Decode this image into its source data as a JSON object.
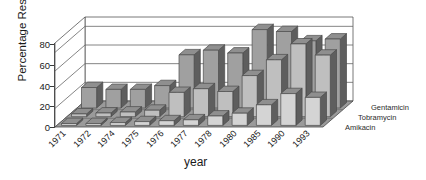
{
  "chart_data": {
    "type": "bar",
    "title": "",
    "subtitle": "",
    "xlabel": "year",
    "ylabel": "Percentage Resistance",
    "ylim": [
      0,
      90
    ],
    "yticks": [
      0,
      20,
      40,
      60,
      80
    ],
    "grid": true,
    "projection": "3d-grouped-depth",
    "legend_position": "right-depth-axis",
    "categories": [
      "1971",
      "1972",
      "1974",
      "1975",
      "1976",
      "1977",
      "1978",
      "1980",
      "1985",
      "1990",
      "1993"
    ],
    "series": [
      {
        "name": "Gentamicin",
        "depth_row": "back",
        "color": "#a0a0a0",
        "values": [
          22,
          20,
          20,
          24,
          57,
          62,
          59,
          84,
          82,
          72,
          74
        ]
      },
      {
        "name": "Tobramycin",
        "depth_row": "middle",
        "color": "#b4b4b4",
        "values": [
          3,
          4,
          5,
          7,
          26,
          30,
          27,
          44,
          61,
          78,
          66
        ]
      },
      {
        "name": "Amikacin",
        "depth_row": "front",
        "color": "#cccccc",
        "values": [
          2,
          2,
          3,
          4,
          5,
          6,
          10,
          13,
          22,
          34,
          30
        ]
      }
    ]
  },
  "legend": {
    "items": [
      {
        "label": "Gentamicin"
      },
      {
        "label": "Tobramycin"
      },
      {
        "label": "Amikacin"
      }
    ]
  },
  "colors": {
    "bar_top": "#8f8f8f",
    "bar_front_back_row": "#a0a0a0",
    "bar_front_mid_row": "#bfbfbf",
    "bar_front_front_row": "#d4d4d4",
    "bar_side": "#5e5e5e",
    "floor": "#9a9a9a",
    "grid": "#666666",
    "axis": "#3a3a3a",
    "text": "#1a1a1a",
    "background": "#ffffff"
  }
}
